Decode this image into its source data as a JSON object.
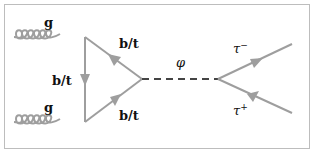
{
  "diagram": {
    "type": "feynman",
    "colors": {
      "line": "#9e9e9e",
      "text": "#111111",
      "border": "#bdbdbd"
    },
    "labels": {
      "gluon_top": "g",
      "gluon_bottom": "g",
      "quark_left": "b/t",
      "quark_top": "b/t",
      "quark_bottom": "b/t",
      "scalar": "φ",
      "tau_minus": "τ",
      "tau_minus_sup": "−",
      "tau_plus": "τ",
      "tau_plus_sup": "+"
    },
    "nodes": [
      {
        "id": "v1",
        "x": 85,
        "y": 37
      },
      {
        "id": "v2",
        "x": 85,
        "y": 122
      },
      {
        "id": "v3",
        "x": 142,
        "y": 79
      },
      {
        "id": "v4",
        "x": 218,
        "y": 79
      }
    ],
    "edges": [
      {
        "from": "in1",
        "to": "v1",
        "kind": "gluon",
        "label": "g"
      },
      {
        "from": "in2",
        "to": "v2",
        "kind": "gluon",
        "label": "g"
      },
      {
        "from": "v1",
        "to": "v2",
        "kind": "fermion",
        "label": "b/t"
      },
      {
        "from": "v3",
        "to": "v1",
        "kind": "fermion",
        "label": "b/t"
      },
      {
        "from": "v2",
        "to": "v3",
        "kind": "fermion",
        "label": "b/t"
      },
      {
        "from": "v3",
        "to": "v4",
        "kind": "scalar-dashed",
        "label": "φ"
      },
      {
        "from": "v4",
        "to": "out1",
        "kind": "fermion",
        "label": "τ−"
      },
      {
        "from": "out2",
        "to": "v4",
        "kind": "fermion",
        "label": "τ+"
      }
    ]
  }
}
